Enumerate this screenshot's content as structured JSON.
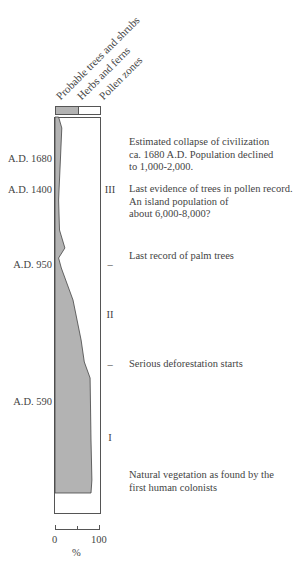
{
  "legend": {
    "items": [
      {
        "label": "Probable trees and shrubs"
      },
      {
        "label": "Herbs and ferns"
      },
      {
        "label": "Pollen zones"
      }
    ]
  },
  "dates": [
    {
      "label": "A.D. 1680",
      "y": 158
    },
    {
      "label": "A.D. 1400",
      "y": 189
    },
    {
      "label": "A.D. 950",
      "y": 264
    },
    {
      "label": "A.D. 590",
      "y": 401
    }
  ],
  "zones": [
    {
      "label": "III",
      "y": 189
    },
    {
      "label": "–",
      "y": 264
    },
    {
      "label": "II",
      "y": 314
    },
    {
      "label": "–",
      "y": 364
    },
    {
      "label": "I",
      "y": 437
    }
  ],
  "notes": [
    {
      "lines": [
        "Estimated collapse of civilization",
        "ca. 1680 A.D.  Population declined",
        "to 1,000-2,000."
      ],
      "y": 136
    },
    {
      "lines": [
        "Last evidence of trees in pollen record.",
        "An island population of",
        "about 6,000-8,000?"
      ],
      "y": 183
    },
    {
      "lines": [
        "Last record of palm trees"
      ],
      "y": 250
    },
    {
      "lines": [
        "Serious deforestation starts"
      ],
      "y": 358
    },
    {
      "lines": [
        "Natural vegetation as found by the",
        "first human colonists"
      ],
      "y": 469
    }
  ],
  "axis": {
    "min_label": "0",
    "max_label": "100",
    "unit": "%"
  },
  "chart_data": {
    "type": "area",
    "xlabel": "%",
    "xlim": [
      0,
      100
    ],
    "series": [
      {
        "name": "Probable trees and shrubs",
        "color": "#b3b3b3",
        "points_percent_by_depth": [
          {
            "depth_y": 117,
            "pct": 8
          },
          {
            "depth_y": 128,
            "pct": 15
          },
          {
            "depth_y": 160,
            "pct": 12
          },
          {
            "depth_y": 200,
            "pct": 8
          },
          {
            "depth_y": 230,
            "pct": 10
          },
          {
            "depth_y": 248,
            "pct": 22
          },
          {
            "depth_y": 258,
            "pct": 8
          },
          {
            "depth_y": 268,
            "pct": 14
          },
          {
            "depth_y": 300,
            "pct": 40
          },
          {
            "depth_y": 340,
            "pct": 58
          },
          {
            "depth_y": 362,
            "pct": 65
          },
          {
            "depth_y": 378,
            "pct": 78
          },
          {
            "depth_y": 440,
            "pct": 80
          },
          {
            "depth_y": 480,
            "pct": 82
          },
          {
            "depth_y": 493,
            "pct": 80
          }
        ]
      },
      {
        "name": "Herbs and ferns",
        "color": "#ffffff"
      }
    ]
  }
}
